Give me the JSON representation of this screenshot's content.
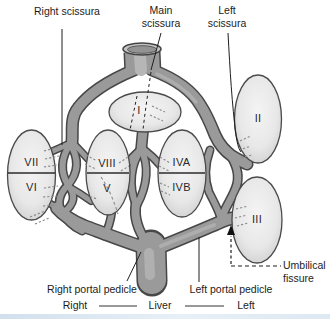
{
  "figure": {
    "labels": {
      "right_scissura": "Right scissura",
      "main_scissura": "Main scissura",
      "left_scissura": "Left scissura",
      "right_portal_pedicle": "Right portal pedicle",
      "left_portal_pedicle": "Left portal pedicle",
      "umbilical_fissure": "Umbilical fissure"
    },
    "segments": {
      "i": "I",
      "ii": "II",
      "iii": "III",
      "iva": "IVA",
      "ivb": "IVB",
      "v": "V",
      "vi": "VI",
      "vii": "VII",
      "viii": "VIII"
    },
    "footer": {
      "right": "Right",
      "center": "Liver",
      "left": "Left"
    },
    "colors": {
      "vessel_fill": "#9a9a9a",
      "vessel_outline": "#474747",
      "segment_fill": "#e8e8e8",
      "segment_stroke": "#4a4a4a",
      "label_text": "#1c1c1c",
      "background": "#ffffff",
      "footer_strip": "#cfdfee"
    }
  }
}
